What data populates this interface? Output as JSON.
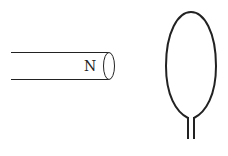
{
  "diagram": {
    "magnet": {
      "pole_label": "N"
    },
    "colors": {
      "stroke": "#222222",
      "background": "#ffffff"
    }
  }
}
